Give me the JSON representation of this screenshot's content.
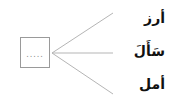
{
  "diagram": {
    "answer_box": {
      "placeholder": "....."
    },
    "options": [
      {
        "label": "أرز"
      },
      {
        "label": "سَأَلَ"
      },
      {
        "label": "أمل"
      }
    ],
    "colors": {
      "line": "#b5b5b5",
      "box_border": "#9a9a9a",
      "text": "#111111"
    }
  }
}
